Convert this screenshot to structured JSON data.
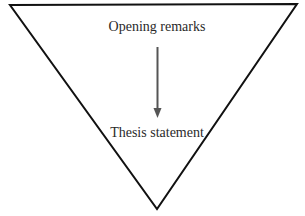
{
  "diagram": {
    "type": "inverted-triangle-funnel",
    "top_label": "Opening remarks",
    "bottom_label": "Thesis statement",
    "arrow_direction": "down",
    "colors": {
      "outline": "#111111",
      "arrow": "#555555",
      "text": "#2a2a2a",
      "background": "#ffffff"
    }
  }
}
